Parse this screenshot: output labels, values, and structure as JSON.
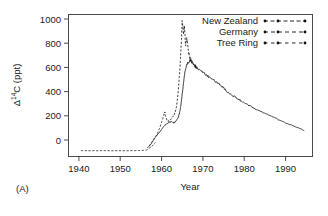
{
  "panel": {
    "label": "(A)"
  },
  "axes": {
    "x": {
      "title": "Year",
      "ticks": [
        1940,
        1950,
        1960,
        1970,
        1980,
        1990
      ],
      "tick_labels": [
        "1940",
        "1950",
        "1960",
        "1970",
        "1980",
        "1990"
      ],
      "range": [
        1936,
        1995
      ]
    },
    "y": {
      "title_delta": "Δ",
      "title_sup": "14",
      "title_rest": "C (ppt)",
      "title": "Δ14C (ppt)",
      "ticks": [
        0,
        200,
        400,
        600,
        800,
        1000
      ],
      "tick_labels": [
        "0",
        "200",
        "400",
        "600",
        "800",
        "1000"
      ],
      "range": [
        -70,
        1040
      ]
    }
  },
  "legend": {
    "position": "top-right",
    "items": [
      {
        "label": "New Zealand",
        "style": "dashed-with-points",
        "color": "#111111"
      },
      {
        "label": "Germany",
        "style": "dashed-with-points",
        "color": "#111111"
      },
      {
        "label": "Tree Ring",
        "style": "dashed-with-points",
        "color": "#111111"
      }
    ]
  },
  "chart_data": {
    "type": "line",
    "title": "",
    "subtitle": "",
    "xlabel": "Year",
    "ylabel": "Δ14C (ppt)",
    "xlim": [
      1936,
      1995
    ],
    "ylim": [
      -70,
      1040
    ],
    "grid": false,
    "legend_position": "top-right",
    "annotations": [
      "(A)"
    ],
    "series": [
      {
        "name": "Tree Ring",
        "color": "#111111",
        "linestyle": "dashed",
        "x": [
          1939,
          1940,
          1941,
          1942,
          1943,
          1944,
          1945,
          1946,
          1947,
          1948,
          1949,
          1950,
          1951,
          1952,
          1953,
          1954,
          1955,
          1956,
          1957
        ],
        "y": [
          -24,
          -24,
          -25,
          -24,
          -25,
          -24,
          -24,
          -25,
          -25,
          -24,
          -25,
          -25,
          -24,
          -24,
          -23,
          -22,
          -18,
          5,
          40
        ]
      },
      {
        "name": "Germany",
        "color": "#111111",
        "linestyle": "dashed",
        "x": [
          1955.5,
          1956.0,
          1956.5,
          1957.0,
          1957.5,
          1958.0,
          1958.5,
          1959.0,
          1959.3,
          1959.6,
          1960.0,
          1960.5,
          1961.0,
          1961.5,
          1962.0,
          1962.5,
          1963.0,
          1963.3,
          1963.5,
          1963.8,
          1964.0,
          1964.3,
          1964.6,
          1965.0,
          1965.3,
          1965.6,
          1966.0,
          1966.5,
          1967.0
        ],
        "y": [
          10,
          35,
          60,
          85,
          110,
          150,
          195,
          250,
          275,
          230,
          205,
          215,
          230,
          250,
          300,
          420,
          650,
          830,
          1000,
          880,
          960,
          800,
          850,
          760,
          700,
          690,
          670,
          640,
          620
        ]
      },
      {
        "name": "New Zealand",
        "color": "#111111",
        "linestyle": "solid-with-points",
        "x": [
          1955.0,
          1955.5,
          1956.0,
          1956.5,
          1957.0,
          1957.5,
          1958.0,
          1958.5,
          1959.0,
          1959.5,
          1960.0,
          1960.5,
          1961.0,
          1961.5,
          1962.0,
          1962.5,
          1963.0,
          1963.5,
          1964.0,
          1964.5,
          1965.0,
          1965.5,
          1966.0,
          1966.5,
          1967.0,
          1968.0,
          1969.0,
          1970.0,
          1971.0,
          1972.0,
          1973.0,
          1974.0,
          1975.0,
          1976.0,
          1977.0,
          1978.0,
          1979.0,
          1980.0,
          1981.0,
          1982.0,
          1983.0,
          1984.0,
          1985.0,
          1986.0,
          1987.0,
          1988.0,
          1989.0,
          1990.0,
          1991.0,
          1992.0,
          1993.0
        ],
        "y": [
          -5,
          10,
          30,
          55,
          80,
          100,
          120,
          140,
          165,
          180,
          190,
          200,
          205,
          190,
          210,
          230,
          290,
          420,
          560,
          640,
          665,
          680,
          660,
          645,
          625,
          600,
          575,
          550,
          530,
          505,
          480,
          450,
          420,
          400,
          380,
          360,
          340,
          325,
          305,
          290,
          275,
          260,
          245,
          230,
          215,
          200,
          185,
          175,
          160,
          148,
          132
        ]
      }
    ],
    "notes": [
      "Atmospheric radiocarbon bomb-pulse curve.",
      "Flat pre-1955 baseline near -25 ppt from tree-ring record.",
      "Germany (northern hemisphere) peaks near 1000 ppt in 1963-64.",
      "New Zealand (southern hemisphere) peaks near 680 ppt in 1965.",
      "Post-peak exponential-like decline to about 130 ppt by 1993."
    ]
  }
}
